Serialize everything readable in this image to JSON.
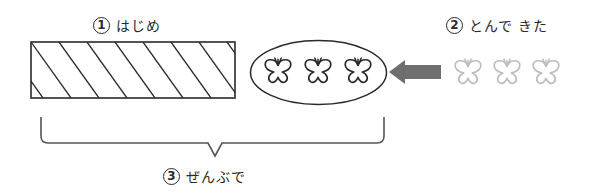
{
  "labels": {
    "start": {
      "number": "1",
      "text": "はじめ"
    },
    "came": {
      "number": "2",
      "text": "とんで きた"
    },
    "total": {
      "number": "3",
      "text": "ぜんぶで"
    }
  },
  "diagram": {
    "initial_block": {
      "shape": "hatched-rectangle",
      "description": "initial quantity (unknown)"
    },
    "group": {
      "shape": "ellipse",
      "butterflies": 3,
      "color": "#2a2a2a"
    },
    "arrow": {
      "direction": "left",
      "color": "#6f6f6f"
    },
    "incoming": {
      "butterflies": 3,
      "color": "#bdbdbd"
    },
    "brace": {
      "spans": "rectangle-and-ellipse"
    }
  }
}
